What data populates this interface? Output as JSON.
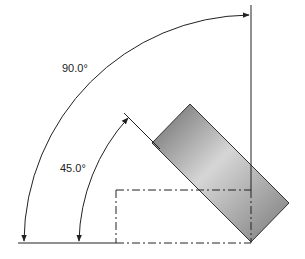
{
  "diagram": {
    "type": "angle-dimension-drawing",
    "labels": {
      "angle_large": "90.0°",
      "angle_small": "45.0°"
    },
    "colors": {
      "line": "#222222",
      "part_dark": "#707070",
      "part_light": "#d8d8d8",
      "background": "#ffffff"
    },
    "elements": [
      {
        "name": "rotated-rectangle",
        "description": "shaded part rotated 45 degrees"
      },
      {
        "name": "phantom-rectangle",
        "description": "dash-dot outline of original position"
      },
      {
        "name": "dimension-arc-90",
        "value": "90.0°"
      },
      {
        "name": "dimension-arc-45",
        "value": "45.0°"
      }
    ]
  }
}
